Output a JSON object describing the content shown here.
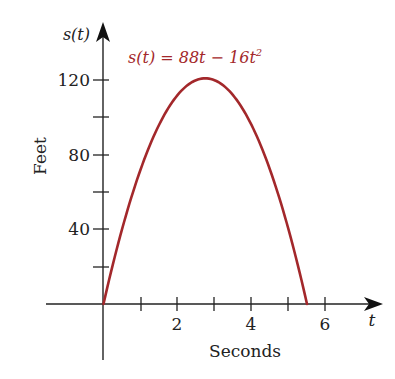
{
  "chart_data": {
    "type": "line",
    "title": "",
    "equation": {
      "prefix": "s(t) = 88t − 16t",
      "exponent": "2",
      "color": "#a3282b"
    },
    "xlabel": "Seconds",
    "ylabel": "Feet",
    "x_axis_var": "t",
    "y_axis_var": "s(t)",
    "xlim": [
      0,
      7.5
    ],
    "ylim": [
      0,
      150
    ],
    "x_ticks": [
      1,
      2,
      3,
      4,
      5,
      6
    ],
    "x_tick_labels": [
      {
        "value": 2,
        "label": "2"
      },
      {
        "value": 4,
        "label": "4"
      },
      {
        "value": 6,
        "label": "6"
      }
    ],
    "y_ticks": [
      20,
      40,
      60,
      80,
      100,
      120
    ],
    "y_tick_labels": [
      {
        "value": 40,
        "label": "40"
      },
      {
        "value": 80,
        "label": "80"
      },
      {
        "value": 120,
        "label": "120"
      }
    ],
    "grid": false,
    "legend": null,
    "series": [
      {
        "name": "s(t) = 88t - 16t^2",
        "color": "#a3282b",
        "x": [
          0,
          0.5,
          1,
          1.5,
          2,
          2.5,
          2.75,
          3,
          3.5,
          4,
          4.5,
          5,
          5.5
        ],
        "values": [
          0,
          40,
          72,
          96,
          112,
          120,
          121,
          120,
          112,
          96,
          72,
          40,
          0
        ]
      }
    ]
  },
  "labels": {
    "y_var": "s(t)",
    "x_var": "t",
    "xlabel": "Seconds",
    "ylabel": "Feet",
    "eq_main": "s(t) = 88t − 16t",
    "eq_exp": "2",
    "x_tick_2": "2",
    "x_tick_4": "4",
    "x_tick_6": "6",
    "y_tick_40": "40",
    "y_tick_80": "80",
    "y_tick_120": "120"
  },
  "colors": {
    "curve": "#a3282b",
    "axes": "#222222"
  }
}
